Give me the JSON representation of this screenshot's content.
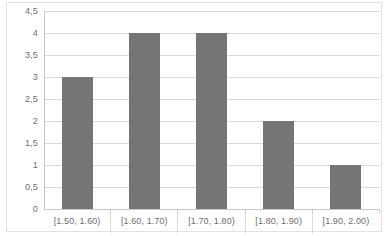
{
  "chart_data": {
    "type": "bar",
    "title": "",
    "subtitle": "",
    "xlabel": "",
    "ylabel": "",
    "categories": [
      "[1.50, 1.60)",
      "[1.60, 1.70)",
      "[1.70, 1.80)",
      "[1.80, 1.90)",
      "[1.90, 2.00)"
    ],
    "values": [
      3,
      4,
      4,
      2,
      1
    ],
    "series": [
      {
        "name": "",
        "values": [
          3,
          4,
          4,
          2,
          1
        ]
      }
    ],
    "ylim": [
      0,
      4.5
    ],
    "ytick_values": [
      0,
      0.5,
      1,
      1.5,
      2,
      2.5,
      3,
      3.5,
      4,
      4.5
    ],
    "ytick_labels": [
      "0",
      "0,5",
      "1",
      "1,5",
      "2",
      "2,5",
      "3",
      "3,5",
      "4",
      "4,5"
    ],
    "decimal_separator": ",",
    "grid": true,
    "grid_axis": "y",
    "legend": false,
    "legend_position": "none",
    "annotations": [],
    "colors": {
      "bar": "#757575",
      "gridline": "#d9d9d9",
      "axis": "#c8c8c8",
      "tick_label": "#6e6e6e",
      "plot_background": "#ffffff",
      "frame_border": "#e2e2e2"
    }
  }
}
